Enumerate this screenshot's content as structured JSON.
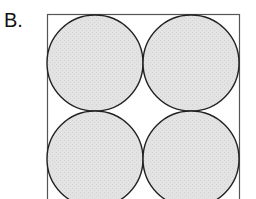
{
  "option_label": "B.",
  "diagram": {
    "square": {
      "x": 47,
      "y": 15,
      "size": 192,
      "stroke": "#555555"
    },
    "circles": [
      {
        "cx": 95,
        "cy": 63,
        "r": 48
      },
      {
        "cx": 191,
        "cy": 63,
        "r": 48
      },
      {
        "cx": 95,
        "cy": 159,
        "r": 48
      },
      {
        "cx": 191,
        "cy": 159,
        "r": 48
      }
    ],
    "circle_fill": "#e3e3e3",
    "circle_stroke": "#222222"
  }
}
